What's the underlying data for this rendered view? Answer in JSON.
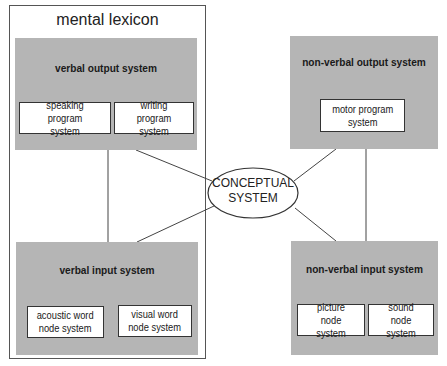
{
  "diagram": {
    "type": "block-diagram",
    "group": {
      "label": "mental lexicon"
    },
    "center": {
      "label_line1": "CONCEPTUAL",
      "label_line2": "SYSTEM"
    },
    "panels": {
      "verbal_output": {
        "title": "verbal output system",
        "subs": [
          {
            "line1": "speaking program",
            "line2": "system"
          },
          {
            "line1": "writing program",
            "line2": "system"
          }
        ]
      },
      "verbal_input": {
        "title": "verbal input system",
        "subs": [
          {
            "line1": "acoustic word",
            "line2": "node system"
          },
          {
            "line1": "visual word",
            "line2": "node system"
          }
        ]
      },
      "nonverbal_output": {
        "title": "non-verbal output system",
        "subs": [
          {
            "line1": "motor program",
            "line2": "system"
          }
        ]
      },
      "nonverbal_input": {
        "title": "non-verbal input system",
        "subs": [
          {
            "line1": "picture node",
            "line2": "system"
          },
          {
            "line1": "sound node",
            "line2": "system"
          }
        ]
      }
    },
    "connections": [
      [
        "verbal output system",
        "verbal input system"
      ],
      [
        "verbal output system",
        "CONCEPTUAL SYSTEM"
      ],
      [
        "verbal input system",
        "CONCEPTUAL SYSTEM"
      ],
      [
        "non-verbal output system",
        "CONCEPTUAL SYSTEM"
      ],
      [
        "non-verbal input system",
        "CONCEPTUAL SYSTEM"
      ],
      [
        "non-verbal output system",
        "non-verbal input system"
      ]
    ],
    "colors": {
      "panel_fill": "#b5b5b5",
      "box_fill": "#ffffff",
      "line": "#444444"
    }
  }
}
